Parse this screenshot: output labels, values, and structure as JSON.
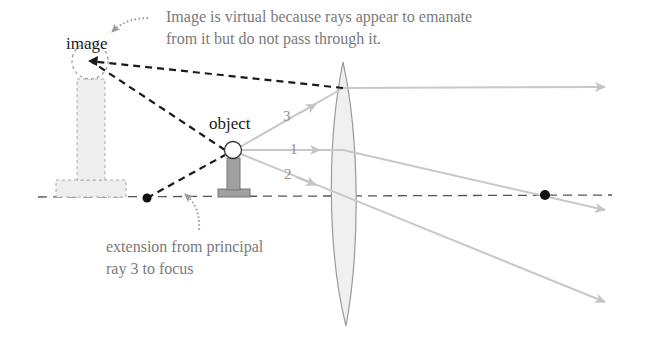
{
  "labels": {
    "image": "image",
    "object": "object",
    "virtual_note_line1": "Image is virtual because rays appear to emanate",
    "virtual_note_line2": "from it but do not pass through it.",
    "extension_note_line1": "extension from principal",
    "extension_note_line2": "ray 3 to focus"
  },
  "rays": [
    {
      "id": "1",
      "label": "1"
    },
    {
      "id": "2",
      "label": "2"
    },
    {
      "id": "3",
      "label": "3"
    }
  ],
  "colors": {
    "ray": "#c8c8c8",
    "dashed_construction": "#1a1a1a",
    "axis": "#555555",
    "focus": "#111111",
    "lens_fill": "#f0f0f0",
    "object_fill": "#a0a0a0",
    "image_fill": "#eeeeee"
  }
}
